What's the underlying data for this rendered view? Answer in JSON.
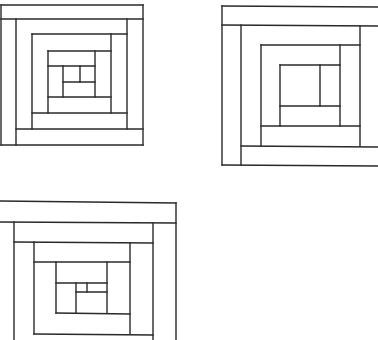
{
  "figure": {
    "title": "",
    "stroke_color": "#2a2a2a",
    "background": "#ffffff",
    "blocks": [
      {
        "id": "block-1",
        "lines": [
          [
            1,
            5,
            143,
            5
          ],
          [
            1,
            19,
            143,
            19
          ],
          [
            1,
            5,
            1,
            145
          ],
          [
            143,
            5,
            143,
            145
          ],
          [
            1,
            145,
            143,
            145
          ],
          [
            16,
            19,
            16,
            145
          ],
          [
            16,
            129,
            143,
            129
          ],
          [
            127,
            19,
            127,
            129
          ],
          [
            32,
            34,
            127,
            34
          ],
          [
            32,
            34,
            32,
            129
          ],
          [
            32,
            113,
            127,
            113
          ],
          [
            111,
            34,
            111,
            113
          ],
          [
            48,
            51,
            111,
            51
          ],
          [
            48,
            51,
            48,
            113
          ],
          [
            48,
            97,
            111,
            97
          ],
          [
            95,
            51,
            95,
            97
          ],
          [
            48,
            66,
            95,
            66
          ],
          [
            63,
            66,
            63,
            97
          ],
          [
            63,
            82,
            95,
            82
          ],
          [
            80,
            66,
            80,
            82
          ]
        ]
      },
      {
        "id": "block-2",
        "lines": [
          [
            222,
            6,
            378,
            7
          ],
          [
            222,
            25,
            378,
            26
          ],
          [
            222,
            6,
            222,
            165
          ],
          [
            222,
            165,
            378,
            166
          ],
          [
            241,
            25,
            241,
            165
          ],
          [
            241,
            146,
            378,
            147
          ],
          [
            360,
            26,
            360,
            146
          ],
          [
            261,
            45,
            360,
            45
          ],
          [
            261,
            45,
            261,
            146
          ],
          [
            261,
            126,
            360,
            126
          ],
          [
            340,
            45,
            340,
            126
          ],
          [
            280,
            65,
            340,
            65
          ],
          [
            280,
            65,
            280,
            126
          ],
          [
            280,
            106,
            340,
            106
          ],
          [
            320,
            65,
            320,
            106
          ]
        ]
      },
      {
        "id": "block-3",
        "lines": [
          [
            0,
            201,
            176,
            203
          ],
          [
            0,
            222,
            176,
            223
          ],
          [
            176,
            203,
            176,
            340
          ],
          [
            14,
            222,
            14,
            340
          ],
          [
            14,
            242,
            153,
            243
          ],
          [
            153,
            223,
            153,
            340
          ],
          [
            34,
            242,
            34,
            334
          ],
          [
            34,
            262,
            130,
            262
          ],
          [
            130,
            243,
            130,
            334
          ],
          [
            34,
            334,
            153,
            335
          ],
          [
            56,
            262,
            56,
            313
          ],
          [
            56,
            283,
            107,
            283
          ],
          [
            107,
            262,
            107,
            313
          ],
          [
            56,
            313,
            130,
            314
          ],
          [
            76,
            283,
            76,
            313
          ],
          [
            76,
            292,
            107,
            292
          ],
          [
            87,
            283,
            87,
            292
          ]
        ]
      }
    ]
  }
}
